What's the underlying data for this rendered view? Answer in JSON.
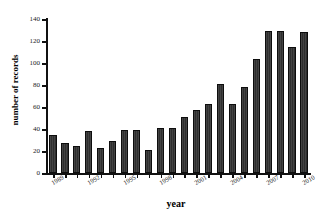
{
  "chart_data": {
    "type": "bar",
    "title": "",
    "xlabel": "year",
    "ylabel": "number of records",
    "categories": [
      "1989",
      "1990",
      "1991",
      "1992",
      "1993",
      "1994",
      "1995",
      "1996",
      "1997",
      "1998",
      "1999",
      "2000",
      "2001",
      "2002",
      "2003",
      "2004",
      "2005",
      "2006",
      "2007",
      "2008",
      "2009",
      "2010"
    ],
    "values": [
      35,
      27,
      25,
      38,
      23,
      29,
      39,
      39,
      21,
      41,
      41,
      51,
      57,
      63,
      81,
      63,
      78,
      104,
      129,
      129,
      115,
      128
    ],
    "ylim": [
      0,
      140
    ],
    "yticks": [
      0,
      20,
      40,
      60,
      80,
      100,
      120,
      140
    ],
    "ytick_labels": [
      "0",
      "20",
      "40",
      "60",
      "80",
      "100",
      "120",
      "140"
    ],
    "xtick_labels": [
      "1989",
      "1992",
      "1995",
      "1998",
      "2001",
      "2004",
      "2007",
      "2010"
    ],
    "xtick_categories": [
      "1989",
      "1992",
      "1995",
      "1998",
      "2001",
      "2004",
      "2007",
      "2010"
    ],
    "grid": false,
    "legend": null,
    "bar_color": "#3a3a3a",
    "bar_edge_color": "#0d0d0d",
    "axis_color": "#111111",
    "background_color": "#ffffff"
  }
}
